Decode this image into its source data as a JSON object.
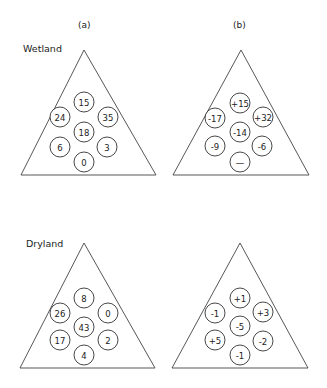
{
  "columns": [
    {
      "label": "(a)",
      "x": 83,
      "y": 25
    },
    {
      "label": "(b)",
      "x": 238,
      "y": 25
    }
  ],
  "rows": [
    {
      "label": "Wetland",
      "x": 23,
      "y": 52
    },
    {
      "label": "Dryland",
      "x": 26,
      "y": 247
    }
  ],
  "panels": [
    {
      "id": "wetland-a",
      "triangle": {
        "apex": [
          84,
          50
        ],
        "left": [
          21,
          175
        ],
        "right": [
          156,
          175
        ]
      },
      "circles": [
        {
          "value": "15",
          "cx": 84,
          "cy": 102
        },
        {
          "value": "24",
          "cx": 60,
          "cy": 117
        },
        {
          "value": "35",
          "cx": 108,
          "cy": 117
        },
        {
          "value": "18",
          "cx": 84,
          "cy": 132
        },
        {
          "value": "6",
          "cx": 60,
          "cy": 147
        },
        {
          "value": "3",
          "cx": 107,
          "cy": 147
        },
        {
          "value": "0",
          "cx": 84,
          "cy": 162
        }
      ]
    },
    {
      "id": "wetland-b",
      "triangle": {
        "apex": [
          241,
          50
        ],
        "left": [
          173,
          175
        ],
        "right": [
          309,
          175
        ]
      },
      "circles": [
        {
          "value": "+15",
          "cx": 240,
          "cy": 103
        },
        {
          "value": "-17",
          "cx": 215,
          "cy": 118
        },
        {
          "value": "+32",
          "cx": 263,
          "cy": 117
        },
        {
          "value": "-14",
          "cx": 240,
          "cy": 132
        },
        {
          "value": "-9",
          "cx": 215,
          "cy": 146
        },
        {
          "value": "-6",
          "cx": 262,
          "cy": 146
        },
        {
          "value": "—",
          "cx": 240,
          "cy": 162
        }
      ]
    },
    {
      "id": "dryland-a",
      "triangle": {
        "apex": [
          84,
          243
        ],
        "left": [
          20,
          368
        ],
        "right": [
          155,
          368
        ]
      },
      "circles": [
        {
          "value": "8",
          "cx": 84,
          "cy": 298
        },
        {
          "value": "26",
          "cx": 60,
          "cy": 313
        },
        {
          "value": "0",
          "cx": 108,
          "cy": 313
        },
        {
          "value": "43",
          "cx": 84,
          "cy": 327
        },
        {
          "value": "17",
          "cx": 60,
          "cy": 340
        },
        {
          "value": "2",
          "cx": 108,
          "cy": 340
        },
        {
          "value": "4",
          "cx": 84,
          "cy": 355
        }
      ]
    },
    {
      "id": "dryland-b",
      "triangle": {
        "apex": [
          240,
          243
        ],
        "left": [
          172,
          368
        ],
        "right": [
          308,
          368
        ]
      },
      "circles": [
        {
          "value": "+1",
          "cx": 240,
          "cy": 298
        },
        {
          "value": "-1",
          "cx": 215,
          "cy": 313
        },
        {
          "value": "+3",
          "cx": 263,
          "cy": 312
        },
        {
          "value": "-5",
          "cx": 240,
          "cy": 326
        },
        {
          "value": "+5",
          "cx": 215,
          "cy": 340
        },
        {
          "value": "-2",
          "cx": 263,
          "cy": 341
        },
        {
          "value": "-1",
          "cx": 240,
          "cy": 355
        }
      ]
    }
  ],
  "style": {
    "circle_radius": 10,
    "line_color": "#444444",
    "background": "#ffffff"
  }
}
